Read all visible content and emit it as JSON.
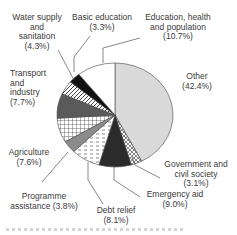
{
  "chart_data": {
    "type": "pie",
    "title": "",
    "slices": [
      {
        "label": "Other",
        "value": 42.4,
        "fill": "#d9d9d9",
        "pattern": "solid-light-grey"
      },
      {
        "label": "Government and civil society",
        "value": 3.1,
        "fill": "#ffffff",
        "pattern": "crosshatch"
      },
      {
        "label": "Emergency aid",
        "value": 9.0,
        "fill": "#2b2b2b",
        "pattern": "solid-dark"
      },
      {
        "label": "Debt relief",
        "value": 8.1,
        "fill": "#ffffff",
        "pattern": "horizontal-dashes"
      },
      {
        "label": "Programme assistance",
        "value": 3.8,
        "fill": "#8c8c8c",
        "pattern": "solid-mid-grey"
      },
      {
        "label": "Agriculture",
        "value": 7.6,
        "fill": "#ffffff",
        "pattern": "grid"
      },
      {
        "label": "Transport and industry",
        "value": 7.7,
        "fill": "#5a5a5a",
        "pattern": "solid-dark-grey"
      },
      {
        "label": "Water supply and sanitation",
        "value": 4.3,
        "fill": "#ffffff",
        "pattern": "diagonal-stripes"
      },
      {
        "label": "Basic education",
        "value": 3.3,
        "fill": "#111111",
        "pattern": "solid-black"
      },
      {
        "label": "Education, health and population",
        "value": 10.7,
        "fill": "#ffffff",
        "pattern": "solid-white"
      }
    ]
  },
  "labels": {
    "water": [
      "Water supply",
      "and",
      "sanitation",
      "(4.3%)"
    ],
    "basic": [
      "Basic education",
      "(3.3%)"
    ],
    "edu": [
      "Education, health",
      "and population",
      "(10.7%)"
    ],
    "other": [
      "Other",
      "(42.4%)"
    ],
    "transport": [
      "Transport",
      "and",
      "industry",
      "(7.7%)"
    ],
    "agri": [
      "Agriculture",
      "(7.6%)"
    ],
    "gov": [
      "Government and",
      "civil society",
      "(3.1%)"
    ],
    "prog": [
      "Programme",
      "assistance (3.8%)"
    ],
    "emerg": [
      "Emergency aid",
      "(9.0%)"
    ],
    "debt": [
      "Debt relief",
      "(8.1%)"
    ]
  }
}
